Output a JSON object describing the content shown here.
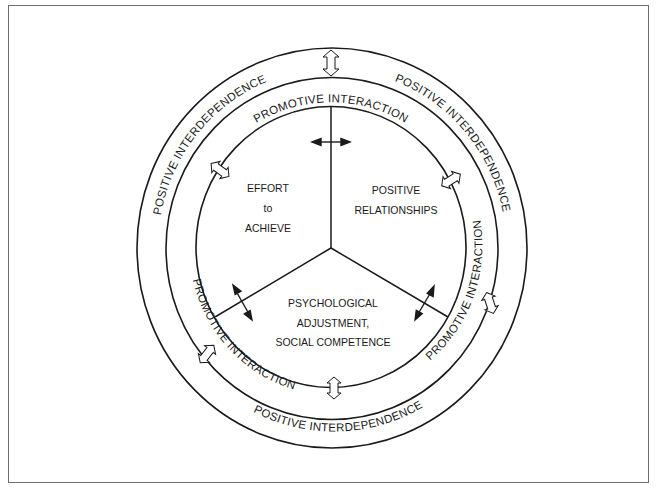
{
  "diagram": {
    "outer_ring": {
      "labels": [
        "POSITIVE INTERDEPENDENCE",
        "POSITIVE INTERDEPENDENCE",
        "POSITIVE INTERDEPENDENCE"
      ]
    },
    "middle_ring": {
      "labels": [
        "PROMOTIVE INTERACTION",
        "PROMOTIVE INTERACTION",
        "PROMOTIVE INTERACTION"
      ]
    },
    "sectors": [
      {
        "lines": [
          "EFFORT",
          "to",
          "ACHIEVE"
        ]
      },
      {
        "lines": [
          "POSITIVE",
          "RELATIONSHIPS"
        ]
      },
      {
        "lines": [
          "PSYCHOLOGICAL",
          "ADJUSTMENT,",
          "SOCIAL COMPETENCE"
        ]
      }
    ],
    "colors": {
      "stroke": "#1a1a1a",
      "frame": "#6e6e6e",
      "background": "#ffffff"
    }
  }
}
